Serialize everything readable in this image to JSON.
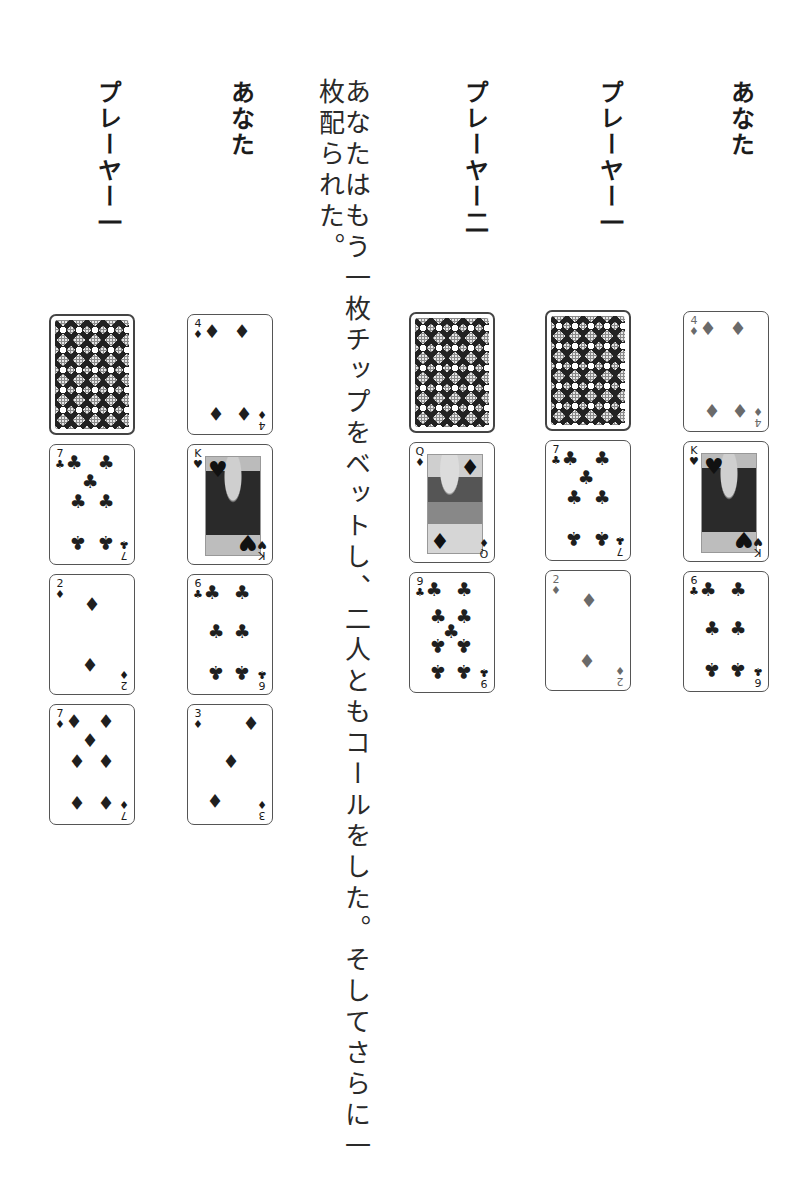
{
  "narrative": "あなたはもう一枚チップをベットし、二人ともコールをした。そしてさらに一枚配られた。",
  "columns": [
    {
      "heading": "あなた",
      "cards": [
        {
          "rank": "4",
          "suit": "♦",
          "face_up": true
        },
        {
          "rank": "K",
          "suit": "♥",
          "face_up": true
        },
        {
          "rank": "6",
          "suit": "♣",
          "face_up": true
        }
      ]
    },
    {
      "heading": "プレーヤー一",
      "cards": [
        {
          "rank": "",
          "suit": "",
          "face_up": false
        },
        {
          "rank": "7",
          "suit": "♣",
          "face_up": true
        },
        {
          "rank": "2",
          "suit": "♦",
          "face_up": true
        }
      ]
    },
    {
      "heading": "プレーヤー二",
      "cards": [
        {
          "rank": "",
          "suit": "",
          "face_up": false
        },
        {
          "rank": "Q",
          "suit": "♦",
          "face_up": true
        },
        {
          "rank": "9",
          "suit": "♣",
          "face_up": true
        }
      ]
    },
    {
      "heading": "あなた",
      "cards": [
        {
          "rank": "4",
          "suit": "♦",
          "face_up": true
        },
        {
          "rank": "K",
          "suit": "♥",
          "face_up": true
        },
        {
          "rank": "6",
          "suit": "♣",
          "face_up": true
        },
        {
          "rank": "3",
          "suit": "♦",
          "face_up": true
        }
      ]
    },
    {
      "heading": "プレーヤー一",
      "cards": [
        {
          "rank": "",
          "suit": "",
          "face_up": false
        },
        {
          "rank": "7",
          "suit": "♣",
          "face_up": true
        },
        {
          "rank": "2",
          "suit": "♦",
          "face_up": true
        },
        {
          "rank": "7",
          "suit": "♦",
          "face_up": true
        }
      ]
    }
  ]
}
